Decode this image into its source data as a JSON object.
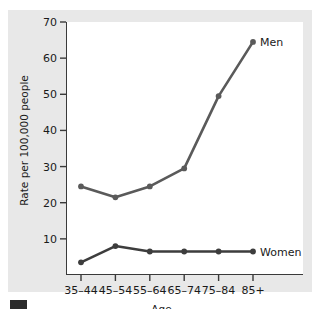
{
  "chart_data": {
    "type": "line",
    "title": "",
    "xlabel": "Age",
    "ylabel": "Rate per 100,000 people",
    "categories": [
      "35–44",
      "45–54",
      "55–64",
      "65–74",
      "75–84",
      "85+"
    ],
    "ylim": [
      0,
      70
    ],
    "yticks": [
      10,
      20,
      30,
      40,
      50,
      60,
      70
    ],
    "ytick_labels": [
      "10",
      "20",
      "30",
      "40",
      "50",
      "60",
      "70"
    ],
    "grid": false,
    "legend_position": "inline-right-of-series-end",
    "series": [
      {
        "name": "Men",
        "values": [
          24.5,
          21.5,
          24.5,
          29.5,
          49.5,
          64.5
        ],
        "color": "#5a5a5a"
      },
      {
        "name": "Women",
        "values": [
          3.5,
          8.0,
          6.5,
          6.5,
          6.5,
          6.5
        ],
        "color": "#3d3d3d"
      }
    ]
  },
  "figure": {
    "background_color": "#e8e8e8",
    "plot_background_color": "#ffffff",
    "axis_color": "#3a3a3a"
  },
  "axis": {
    "x_title": "Age",
    "y_title": "Rate per 100,000 people"
  }
}
